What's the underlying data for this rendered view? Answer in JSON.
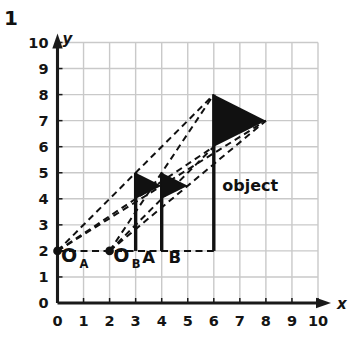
{
  "problem": {
    "number": "1"
  },
  "axes": {
    "x_label": "x",
    "y_label": "y",
    "x_ticks": [
      "0",
      "1",
      "2",
      "3",
      "4",
      "5",
      "6",
      "7",
      "8",
      "9",
      "10"
    ],
    "y_ticks": [
      "0",
      "1",
      "2",
      "3",
      "4",
      "5",
      "6",
      "7",
      "8",
      "9",
      "10"
    ]
  },
  "labels": {
    "observer_a": "O",
    "observer_a_sub": "A",
    "observer_b": "O",
    "observer_b_sub": "B",
    "image_a": "A",
    "image_b": "B",
    "object": "object"
  },
  "colors": {
    "grid": "#c9c9c9",
    "axis": "#1a1a1a",
    "ink": "#111111",
    "background": "#ffffff"
  },
  "chart_data": {
    "type": "scatter",
    "title": "",
    "xlabel": "x",
    "ylabel": "y",
    "xlim": [
      0,
      10
    ],
    "ylim": [
      0,
      10
    ],
    "xticks": [
      0,
      1,
      2,
      3,
      4,
      5,
      6,
      7,
      8,
      9,
      10
    ],
    "yticks": [
      0,
      1,
      2,
      3,
      4,
      5,
      6,
      7,
      8,
      9,
      10
    ],
    "grid": true,
    "legend": "none",
    "points": [
      {
        "name": "O_A",
        "x": 0,
        "y": 2,
        "marker": "filled-dot"
      },
      {
        "name": "O_B",
        "x": 2,
        "y": 2,
        "marker": "filled-dot"
      }
    ],
    "flags": [
      {
        "name": "object",
        "pole_x": 6,
        "pole_y0": 2,
        "pole_y1": 8,
        "triangle": [
          [
            6,
            8
          ],
          [
            8,
            7
          ],
          [
            6,
            6
          ]
        ],
        "label": "object",
        "label_x": 7.4,
        "label_y": 4.3
      },
      {
        "name": "image A",
        "pole_x": 3,
        "pole_y0": 2,
        "pole_y1": 5,
        "triangle": [
          [
            3,
            5
          ],
          [
            4,
            4.5
          ],
          [
            3,
            4
          ]
        ],
        "label": "A",
        "label_x": 3.5,
        "label_y": 1.55
      },
      {
        "name": "image B",
        "pole_x": 4,
        "pole_y0": 2,
        "pole_y1": 5,
        "triangle": [
          [
            4,
            5
          ],
          [
            5,
            4.5
          ],
          [
            4,
            4
          ]
        ],
        "label": "B",
        "label_x": 4.5,
        "label_y": 1.55
      }
    ],
    "dashed_rays": [
      {
        "from": [
          0,
          2
        ],
        "to": [
          6,
          8
        ]
      },
      {
        "from": [
          0,
          2
        ],
        "to": [
          8,
          7
        ]
      },
      {
        "from": [
          0,
          2
        ],
        "to": [
          6,
          6
        ]
      },
      {
        "from": [
          2,
          2
        ],
        "to": [
          6,
          8
        ]
      },
      {
        "from": [
          2,
          2
        ],
        "to": [
          8,
          7
        ]
      },
      {
        "from": [
          2,
          2
        ],
        "to": [
          6,
          6
        ]
      }
    ],
    "dashed_baseline": {
      "from": [
        0,
        2
      ],
      "to": [
        6,
        2
      ]
    }
  }
}
